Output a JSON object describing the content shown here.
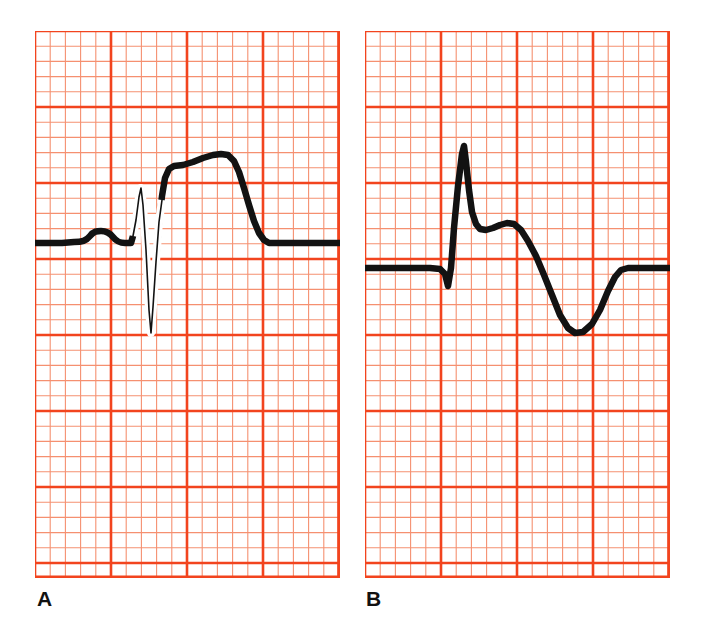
{
  "figure": {
    "background_color": "#ffffff",
    "width": 703,
    "height": 642
  },
  "grid": {
    "small_box_px": 15.2,
    "large_box_small_count": 5,
    "thin_line_color": "#F59070",
    "thick_line_color": "#F2441E",
    "thin_line_width": 1.1,
    "thick_line_width": 2.6,
    "paper_color": "#ffffff"
  },
  "trace": {
    "color": "#121212",
    "thick_width": 6.5,
    "thin_width": 1.6
  },
  "panels": [
    {
      "id": "A",
      "label": "A",
      "label_x": 37,
      "label_y": 588,
      "rect": {
        "x": 35,
        "y": 31,
        "w": 305,
        "h": 547
      },
      "baseline_y": 243,
      "description": "ECG complex with P wave, tall narrow R, deep narrow S, elevated coved ST segment and broad T wave",
      "chart_data": {
        "type": "line",
        "title": "ECG complex A",
        "xlabel": "",
        "ylabel": "",
        "baseline_mv": 0,
        "features": [
          {
            "name": "baseline-start",
            "x": 35,
            "y": 243
          },
          {
            "name": "P-wave-peak",
            "x": 100,
            "y": 232
          },
          {
            "name": "PR-segment",
            "x": 130,
            "y": 243
          },
          {
            "name": "R-wave-peak",
            "x": 141,
            "y": 188
          },
          {
            "name": "S-wave-nadir",
            "x": 150,
            "y": 333
          },
          {
            "name": "ST-shoulder",
            "x": 180,
            "y": 166
          },
          {
            "name": "T-wave-peak",
            "x": 215,
            "y": 154
          },
          {
            "name": "T-wave-end",
            "x": 268,
            "y": 243
          },
          {
            "name": "baseline-end",
            "x": 340,
            "y": 243
          }
        ]
      },
      "path": "M 35,243 L 62,243 L 74,242 C 82,242 86,241 90,236 C 94,231 97,231 101,231 C 105,231 109,232 113,237 C 117,242 120,243 125,243 L 131,243 L 133,236 L 136,220 L 139,197 L 141,188 L 143,205 L 146,250 L 149,310 L 151,333 L 153,307 L 156,262 L 159,222 L 162,196 L 165,178 L 169,169 L 174,166 L 183,165 L 193,162 L 203,158 L 213,155 L 221,154 L 228,155 L 234,161 L 239,172 L 244,188 L 249,205 L 254,221 L 259,233 L 264,240 L 269,243 L 285,243 L 340,243",
      "thin_segments": [
        "M 133,236 L 136,220 L 139,197 L 141,188 L 143,205 L 146,250 L 149,310 L 151,333 L 153,307 L 156,262 L 159,222 L 162,200"
      ]
    },
    {
      "id": "B",
      "label": "B",
      "label_x": 366,
      "label_y": 588,
      "rect": {
        "x": 365,
        "y": 31,
        "w": 305,
        "h": 547
      },
      "baseline_y": 268,
      "description": "ECG complex with small Q wave, tall narrow R wave, notched ST plateau and deep broad inverted T wave",
      "chart_data": {
        "type": "line",
        "title": "ECG complex B",
        "xlabel": "",
        "ylabel": "",
        "baseline_mv": 0,
        "features": [
          {
            "name": "baseline-start",
            "x": 365,
            "y": 268
          },
          {
            "name": "Q-wave-nadir",
            "x": 448,
            "y": 286
          },
          {
            "name": "R-wave-peak",
            "x": 464,
            "y": 146
          },
          {
            "name": "ST-notch-low",
            "x": 486,
            "y": 229
          },
          {
            "name": "ST-notch-high",
            "x": 508,
            "y": 223
          },
          {
            "name": "T-wave-trough",
            "x": 572,
            "y": 333
          },
          {
            "name": "T-wave-end",
            "x": 620,
            "y": 269
          },
          {
            "name": "baseline-end",
            "x": 670,
            "y": 268
          }
        ]
      },
      "path": "M 365,268 L 430,268 L 440,269 L 445,274 L 448,286 L 451,268 L 454,228 L 458,186 L 462,154 L 464,146 L 466,162 L 469,190 L 472,212 L 476,224 L 480,229 L 486,230 L 493,228 L 500,225 L 507,223 L 514,224 L 521,230 L 528,241 L 536,256 L 544,275 L 552,295 L 560,315 L 568,328 L 575,333 L 583,332 L 592,324 L 600,310 L 608,291 L 615,277 L 621,270 L 628,268 L 640,268 L 670,268",
      "thin_segments": []
    }
  ]
}
